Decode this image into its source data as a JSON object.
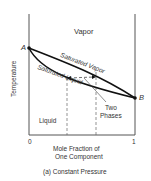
{
  "diagram": {
    "title": "(a) Constant Pressure",
    "y_axis_label": "Temperature",
    "x_axis_label_line1": "Mole Fraction of",
    "x_axis_label_line2": "One Component",
    "x_tick_start": "0",
    "x_tick_end": "1",
    "point_a": "A",
    "point_b": "B",
    "regions": {
      "vapor": "Vapor",
      "liquid": "Liquid",
      "two_phases_line1": "Two",
      "two_phases_line2": "Phases"
    },
    "curves": {
      "saturated_vapor": "Saturated Vapor",
      "saturated_liquid": "Saturated Liquid"
    },
    "colors": {
      "line": "#111111",
      "frame": "#555555",
      "dashed": "#666666"
    }
  }
}
